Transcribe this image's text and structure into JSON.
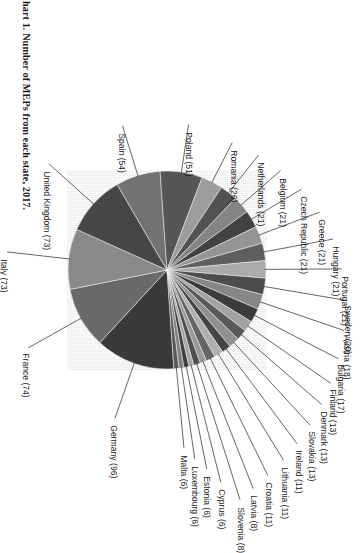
{
  "title": "Chart 1.  Number of MEPs from each state, 2017.",
  "chart_data": {
    "type": "pie",
    "title": "Chart 1.  Number of MEPs from each state, 2017.",
    "xlabel": "",
    "ylabel": "",
    "legend": "none",
    "grid": false,
    "total": 751,
    "value_unit": "MEPs",
    "categories": [
      "Germany",
      "France",
      "Italy",
      "United Kingdom",
      "Spain",
      "Poland",
      "Romania",
      "Netherlands",
      "Belgium",
      "Czech Republic",
      "Greece",
      "Hungary",
      "Portugal",
      "Sweden",
      "Austria",
      "Bulgaria",
      "Finland",
      "Denmark",
      "Slovakia",
      "Ireland",
      "Lithuania",
      "Croatia",
      "Latvia",
      "Slovenia",
      "Cyprus",
      "Estonia",
      "Luxembourg",
      "Malta"
    ],
    "values": [
      96,
      74,
      73,
      73,
      54,
      51,
      32,
      26,
      21,
      21,
      21,
      21,
      21,
      20,
      18,
      17,
      13,
      13,
      13,
      11,
      11,
      11,
      8,
      8,
      6,
      6,
      6,
      6
    ],
    "slices": [
      {
        "label": "Germany (96)",
        "name": "Germany",
        "value": 96,
        "color": "#3d3d3d"
      },
      {
        "label": "France (74)",
        "name": "France",
        "value": 74,
        "color": "#6e6e6e"
      },
      {
        "label": "Italy (73)",
        "name": "Italy",
        "value": 73,
        "color": "#8f8f8f"
      },
      {
        "label": "United Kingdom (73)",
        "name": "United Kingdom",
        "value": 73,
        "color": "#4a4a4a"
      },
      {
        "label": "Spain (54)",
        "name": "Spain",
        "value": 54,
        "color": "#777777"
      },
      {
        "label": "Poland (51)",
        "name": "Poland",
        "value": 51,
        "color": "#5a5a5a"
      },
      {
        "label": "Romania (26)",
        "name": "Romania",
        "value": 26,
        "color": "#a2a2a2"
      },
      {
        "label": "Netherlands (21)",
        "name": "Netherlands",
        "value": 21,
        "color": "#565656"
      },
      {
        "label": "Belgium (21)",
        "name": "Belgium",
        "value": 21,
        "color": "#8a8a8a"
      },
      {
        "label": "Czech Republic (21)",
        "name": "Czech Republic",
        "value": 21,
        "color": "#464646"
      },
      {
        "label": "Greece (21)",
        "name": "Greece",
        "value": 21,
        "color": "#9b9b9b"
      },
      {
        "label": "Hungary (21)",
        "name": "Hungary",
        "value": 21,
        "color": "#636363"
      },
      {
        "label": "Portugal (21)",
        "name": "Portugal",
        "value": 21,
        "color": "#b0b0b0"
      },
      {
        "label": "Sweden (20)",
        "name": "Sweden",
        "value": 20,
        "color": "#505050"
      },
      {
        "label": "Austria (18)",
        "name": "Austria",
        "value": 18,
        "color": "#8c8c8c"
      },
      {
        "label": "Bulgaria (17)",
        "name": "Bulgaria",
        "value": 17,
        "color": "#3f3f3f"
      },
      {
        "label": "Finland (13)",
        "name": "Finland",
        "value": 13,
        "color": "#a8a8a8"
      },
      {
        "label": "Denmark (13)",
        "name": "Denmark",
        "value": 13,
        "color": "#5e5e5e"
      },
      {
        "label": "Slovakia (13)",
        "name": "Slovakia",
        "value": 13,
        "color": "#969696"
      },
      {
        "label": "Ireland (11)",
        "name": "Ireland",
        "value": 11,
        "color": "#484848"
      },
      {
        "label": "Lithuania (11)",
        "name": "Lithuania",
        "value": 11,
        "color": "#b6b6b6"
      },
      {
        "label": "Croatia (11)",
        "name": "Croatia",
        "value": 11,
        "color": "#6a6a6a"
      },
      {
        "label": "Latvia (8)",
        "name": "Latvia",
        "value": 8,
        "color": "#9f9f9f"
      },
      {
        "label": "Slovenia (8)",
        "name": "Slovenia",
        "value": 8,
        "color": "#535353"
      },
      {
        "label": "Cyprus (6)",
        "name": "Cyprus",
        "value": 6,
        "color": "#ababab"
      },
      {
        "label": "Estonia (6)",
        "name": "Estonia",
        "value": 6,
        "color": "#414141"
      },
      {
        "label": "Luxembourg (6)",
        "name": "Luxembourg",
        "value": 6,
        "color": "#878787"
      },
      {
        "label": "Malta (6)",
        "name": "Malta",
        "value": 6,
        "color": "#606060"
      }
    ]
  },
  "labels": {
    "germany": "Germany (96)",
    "france": "France (74)",
    "italy": "Italy (73)",
    "united_kingdom": "United Kingdom (73)",
    "spain": "Spain (54)",
    "poland": "Poland (51)",
    "romania": "Romania (26)",
    "netherlands": "Netherlands (21)",
    "belgium": "Belgium (21)",
    "czech_republic": "Czech Republic (21)",
    "greece": "Greece (21)",
    "hungary": "Hungary (21)",
    "portugal": "Portugal (21)",
    "sweden": "Sweden (20)",
    "austria": "Austria (18)",
    "bulgaria": "Bulgaria (17)",
    "finland": "Finland (13)",
    "denmark": "Denmark (13)",
    "slovakia": "Slovakia (13)",
    "ireland": "Ireland (11)",
    "lithuania": "Lithuania (11)",
    "croatia": "Croatia (11)",
    "latvia": "Latvia (8)",
    "slovenia": "Slovenia (8)",
    "cyprus": "Cyprus (6)",
    "estonia": "Estonia (6)",
    "luxembourg": "Luxembourg (6)",
    "malta": "Malta (6)"
  }
}
